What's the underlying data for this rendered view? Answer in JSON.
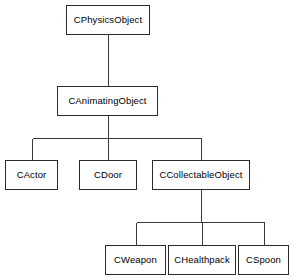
{
  "diagram": {
    "kind": "class-inheritance-tree",
    "background_color": "#ffffff",
    "box_fill_color": "#ffffff",
    "box_border_color": "#2b2b2b",
    "text_color": "#000000",
    "connector_color": "#3a3a3a",
    "nodes": [
      {
        "id": "cphysicsobject",
        "label": "CPhysicsObject",
        "level": 0,
        "x": 66,
        "y": 5,
        "w": 84,
        "h": 30
      },
      {
        "id": "canimatingobject",
        "label": "CAnimatingObject",
        "level": 1,
        "x": 57,
        "y": 86,
        "w": 101,
        "h": 30
      },
      {
        "id": "cactor",
        "label": "CActor",
        "level": 2,
        "x": 5,
        "y": 160,
        "w": 53,
        "h": 30
      },
      {
        "id": "cdoor",
        "label": "CDoor",
        "level": 2,
        "x": 79,
        "y": 160,
        "w": 58,
        "h": 30
      },
      {
        "id": "ccollectableobject",
        "label": "CCollectableObject",
        "level": 2,
        "x": 152,
        "y": 160,
        "w": 98,
        "h": 30
      },
      {
        "id": "cweapon",
        "label": "CWeapon",
        "level": 3,
        "x": 105,
        "y": 245,
        "w": 61,
        "h": 30
      },
      {
        "id": "chealthpack",
        "label": "CHealthpack",
        "level": 3,
        "x": 168,
        "y": 245,
        "w": 68,
        "h": 30
      },
      {
        "id": "cspoon",
        "label": "CSpoon",
        "level": 3,
        "x": 238,
        "y": 245,
        "w": 51,
        "h": 30
      }
    ],
    "edges": [
      {
        "from": "cphysicsobject",
        "to": "canimatingobject",
        "type": "straight"
      },
      {
        "from": "canimatingobject",
        "to": "cactor",
        "type": "elbow",
        "bus_y": 138
      },
      {
        "from": "canimatingobject",
        "to": "cdoor",
        "type": "elbow",
        "bus_y": 138
      },
      {
        "from": "canimatingobject",
        "to": "ccollectableobject",
        "type": "elbow",
        "bus_y": 138
      },
      {
        "from": "ccollectableobject",
        "to": "cweapon",
        "type": "elbow",
        "bus_y": 222
      },
      {
        "from": "ccollectableobject",
        "to": "chealthpack",
        "type": "elbow",
        "bus_y": 222
      },
      {
        "from": "ccollectableobject",
        "to": "cspoon",
        "type": "elbow",
        "bus_y": 222
      }
    ]
  }
}
